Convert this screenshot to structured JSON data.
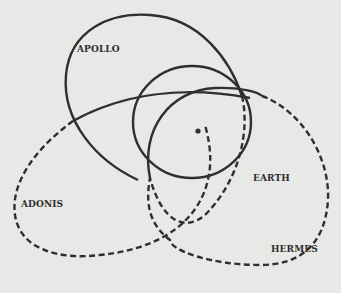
{
  "diagram": {
    "labels": {
      "apollo": "APOLLO",
      "earth": "EARTH",
      "adonis": "ADONIS",
      "hermes": "HERMES"
    },
    "orbits": [
      {
        "name": "Apollo",
        "style": "solid with dashed portion"
      },
      {
        "name": "Earth",
        "style": "solid"
      },
      {
        "name": "Adonis",
        "style": "solid/dashed"
      },
      {
        "name": "Hermes",
        "style": "solid/dashed"
      }
    ],
    "center": "Sun",
    "colors": {
      "background": "#e8e8e6",
      "ink": "#2f2f2f"
    }
  }
}
